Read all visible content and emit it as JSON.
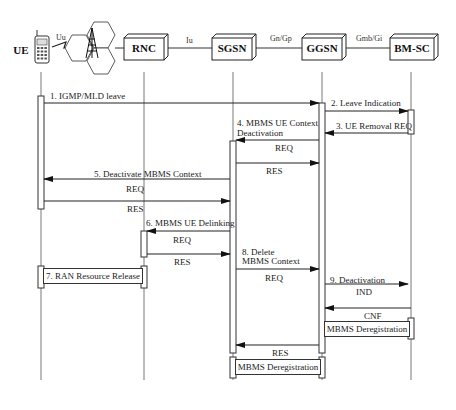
{
  "diagram": {
    "type": "sequence",
    "entities": [
      {
        "id": "ue",
        "label": "UE",
        "icon": "mobile-phone-icon"
      },
      {
        "id": "rnc",
        "label": "RNC"
      },
      {
        "id": "sgsn",
        "label": "SGSN"
      },
      {
        "id": "ggsn",
        "label": "GGSN"
      },
      {
        "id": "bmsc",
        "label": "BM-SC"
      }
    ],
    "interfaces": {
      "uu": "Uu",
      "iu": "Iu",
      "gn_gp": "Gn/Gp",
      "gmb_gi": "Gmb/Gi"
    },
    "messages": {
      "m1": "1. IGMP/MLD leave",
      "m2": "2. Leave Indication",
      "m3": "3. UE Removal REQ",
      "m4_line1": "4. MBMS UE Context",
      "m4_line2": "Deactivation",
      "m4_req": "REQ",
      "m4_res": "RES",
      "m5": "5. Deactivate MBMS Context",
      "m5_req": "REQ",
      "m5_res": "RES",
      "m6": "6. MBMS UE Delinking",
      "m6_req": "REQ",
      "m6_res": "RES",
      "m7": "7. RAN Resource Release",
      "m8_line1": "8. Delete",
      "m8_line2": "MBMS Context",
      "m8_req": "REQ",
      "m8_res": "RES",
      "m9": "9. Deactivation",
      "m9_ind": "IND",
      "m9_cnf": "CNF",
      "dereg_bmsc": "MBMS Deregistration",
      "dereg_sgsn": "MBMS Deregistration"
    }
  }
}
